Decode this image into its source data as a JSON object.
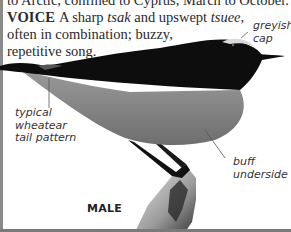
{
  "text": {
    "cut_line": "to Arctic, confined to Cyprus, March to October.",
    "voice_label": "VOICE",
    "voice_a": "A sharp ",
    "voice_call1": "tsak",
    "voice_b": " and upswept ",
    "voice_call2": "tsuee",
    "voice_c": ",",
    "line2": "often in combination; buzzy,",
    "line3": "repetitive song."
  },
  "annotations": {
    "cap": [
      "greyish",
      "cap"
    ],
    "tail": [
      "typical",
      "wheatear",
      "tail pattern"
    ],
    "underside": [
      "buff",
      "underside"
    ]
  },
  "figure": {
    "sex_label": "MALE"
  },
  "colors": {
    "text": "#2a2a2a",
    "bird_dark": "#0d0d0d",
    "bird_belly": "#8c8c8c",
    "cap_highlight": "#d8d8d8",
    "border": "#8a8a8a"
  }
}
